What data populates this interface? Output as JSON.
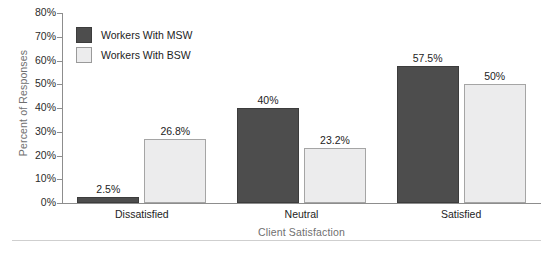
{
  "chart_data": {
    "type": "bar",
    "title": "",
    "xlabel": "Client Satisfaction",
    "ylabel": "Percent of Responses",
    "categories": [
      "Dissatisfied",
      "Neutral",
      "Satisfied"
    ],
    "ylim": [
      0,
      80
    ],
    "ytick_labels": [
      "80%",
      "70%",
      "60%",
      "50%",
      "40%",
      "30%",
      "20%",
      "10%",
      "0%"
    ],
    "ytick_values": [
      80,
      70,
      60,
      50,
      40,
      30,
      20,
      10,
      0
    ],
    "grid": false,
    "legend_position": "upper-left-inside",
    "series": [
      {
        "name": "Workers With MSW",
        "color": "#4d4d4d",
        "border_color": "#3c3c3c",
        "values": [
          2.5,
          40,
          57.5
        ],
        "labels": [
          "2.5%",
          "40%",
          "57.5%"
        ]
      },
      {
        "name": "Workers With BSW",
        "color": "#ececed",
        "border_color": "#a5a5a5",
        "values": [
          26.8,
          23.2,
          50
        ],
        "labels": [
          "26.8%",
          "23.2%",
          "50%"
        ]
      }
    ]
  },
  "axis": {
    "y_title": "Percent of Responses",
    "x_title": "Client Satisfaction"
  },
  "legend": {
    "items": [
      {
        "label": "Workers With MSW"
      },
      {
        "label": "Workers With BSW"
      }
    ]
  },
  "colors": {
    "series_msw": "#4d4d4d",
    "series_bsw": "#ececed",
    "axis_line": "#8d8d8d",
    "axis_title_text": "#6f6f6f",
    "tick_text": "#1d1d1d",
    "bottom_rule": "#cfcfcf",
    "background": "#ffffff"
  }
}
